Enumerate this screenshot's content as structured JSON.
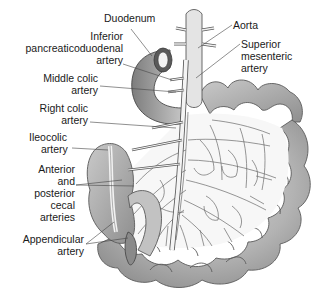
{
  "diagram": {
    "labels": {
      "duodenum": [
        "Duodenum"
      ],
      "inferior_pancreaticoduodenal": [
        "Inferior",
        "pancreaticoduodenal",
        "artery"
      ],
      "middle_colic": [
        "Middle colic",
        "artery"
      ],
      "right_colic": [
        "Right colic",
        "artery"
      ],
      "ileocolic": [
        "Ileocolic",
        "artery"
      ],
      "cecal": [
        "Anterior",
        "and",
        "posterior",
        "cecal",
        "arteries"
      ],
      "appendicular": [
        "Appendicular",
        "artery"
      ],
      "aorta": [
        "Aorta"
      ],
      "superior_mesenteric": [
        "Superior",
        "mesenteric",
        "artery"
      ]
    },
    "colors": {
      "intestine_fill": "#b8b8b8",
      "intestine_dark": "#8a8a8a",
      "artery_fill": "#f2f2f2",
      "outline": "#555555",
      "leader_line": "#444444",
      "text": "#1a1a1a"
    }
  }
}
